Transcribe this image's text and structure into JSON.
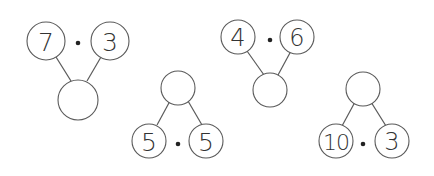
{
  "worksheet": {
    "topic": "number bonds with multiplication",
    "operator_symbol": "·",
    "problems": [
      {
        "orientation": "down",
        "left": "7",
        "right": "3",
        "result": ""
      },
      {
        "orientation": "up",
        "left": "5",
        "right": "5",
        "result": ""
      },
      {
        "orientation": "down",
        "left": "4",
        "right": "6",
        "result": ""
      },
      {
        "orientation": "up",
        "left": "10",
        "right": "3",
        "result": ""
      }
    ]
  }
}
